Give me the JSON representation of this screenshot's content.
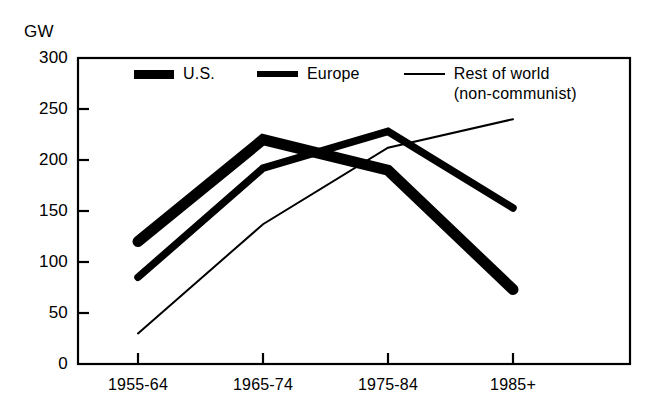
{
  "chart_data": {
    "type": "line",
    "title": "",
    "xlabel": "",
    "ylabel": "GW",
    "ylim": [
      0,
      300
    ],
    "yticks": [
      0,
      50,
      100,
      150,
      200,
      250,
      300
    ],
    "ytick_labels": [
      "0",
      "50",
      "100",
      "150",
      "200",
      "250",
      "300"
    ],
    "categories": [
      "1955-64",
      "1965-74",
      "1975-84",
      "1985+"
    ],
    "grid": false,
    "legend_position": "top-center-inside",
    "series": [
      {
        "name": "U.S.",
        "values": [
          120,
          220,
          190,
          73
        ],
        "line_style": "very-thick",
        "color": "#000000"
      },
      {
        "name": "Europe",
        "values": [
          85,
          192,
          228,
          153
        ],
        "line_style": "thick",
        "color": "#000000"
      },
      {
        "name": "Rest of world (non-communist)",
        "values": [
          30,
          137,
          212,
          240
        ],
        "line_style": "thin",
        "color": "#000000"
      }
    ]
  },
  "legend": {
    "items": [
      {
        "label": "U.S.",
        "sub": "",
        "marker": "thick-bar-icon"
      },
      {
        "label": "Europe",
        "sub": "",
        "marker": "medium-bar-icon"
      },
      {
        "label": "Rest of world",
        "sub": "(non-communist)",
        "marker": "thin-line-icon"
      }
    ]
  },
  "axis": {
    "unit": "GW"
  },
  "style": {
    "ink": "#000000",
    "background": "#ffffff"
  }
}
